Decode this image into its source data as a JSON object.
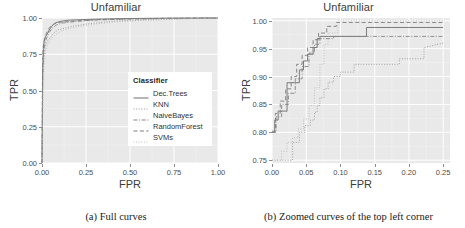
{
  "figure": {
    "panels": [
      {
        "id": "a",
        "title": "Unfamiliar",
        "caption": "(a) Full curves",
        "xlabel": "FPR",
        "ylabel": "TPR",
        "xticks": [
          "0.00",
          "0.25",
          "0.50",
          "0.75",
          "1.00"
        ],
        "yticks": [
          "0.00",
          "0.25",
          "0.50",
          "0.75",
          "1.00"
        ]
      },
      {
        "id": "b",
        "title": "Unfamiliar",
        "caption": "(b) Zoomed curves of the top left corner",
        "xlabel": "FPR",
        "ylabel": "TPR",
        "xticks": [
          "0.00",
          "0.05",
          "0.10",
          "0.15",
          "0.20",
          "0.25"
        ],
        "yticks": [
          "0.75",
          "0.80",
          "0.85",
          "0.90",
          "0.95",
          "1.00"
        ]
      }
    ]
  },
  "legend": {
    "title": "Classifier",
    "items": [
      {
        "label": "Dec.Trees",
        "style": "solid",
        "color": "#6e6e6e"
      },
      {
        "label": "KNN",
        "style": "dotted",
        "color": "#9a9a9a"
      },
      {
        "label": "NaiveBayes",
        "style": "dashdot",
        "color": "#858585"
      },
      {
        "label": "RandomForest",
        "style": "dashed",
        "color": "#7d7d7d"
      },
      {
        "label": "SVMs",
        "style": "finedot",
        "color": "#b0b0b0"
      }
    ]
  },
  "chart_data": [
    {
      "type": "line",
      "panel": "a",
      "title": "Unfamiliar",
      "xlabel": "FPR",
      "ylabel": "TPR",
      "xlim": [
        0.0,
        1.0
      ],
      "ylim": [
        0.0,
        1.0
      ],
      "grid": true,
      "legend_position": "inside-center-right",
      "series": [
        {
          "name": "Dec.Trees",
          "x": [
            0.0,
            0.004,
            0.008,
            0.012,
            0.02,
            0.03,
            0.045,
            0.06,
            0.08,
            0.11,
            0.15,
            0.21,
            0.3,
            0.45,
            0.7,
            1.0
          ],
          "y": [
            0.0,
            0.64,
            0.79,
            0.838,
            0.87,
            0.89,
            0.925,
            0.95,
            0.968,
            0.978,
            0.985,
            0.988,
            0.992,
            0.996,
            0.999,
            1.0
          ]
        },
        {
          "name": "KNN",
          "x": [
            0.0,
            0.005,
            0.01,
            0.018,
            0.03,
            0.048,
            0.07,
            0.095,
            0.13,
            0.185,
            0.26,
            0.38,
            0.56,
            0.8,
            1.0
          ],
          "y": [
            0.0,
            0.56,
            0.72,
            0.8,
            0.84,
            0.866,
            0.9,
            0.92,
            0.93,
            0.946,
            0.96,
            0.976,
            0.988,
            0.996,
            1.0
          ]
        },
        {
          "name": "NaiveBayes",
          "x": [
            0.0,
            0.004,
            0.009,
            0.016,
            0.026,
            0.04,
            0.058,
            0.082,
            0.115,
            0.16,
            0.23,
            0.34,
            0.52,
            0.76,
            1.0
          ],
          "y": [
            0.0,
            0.6,
            0.76,
            0.82,
            0.862,
            0.9,
            0.93,
            0.952,
            0.965,
            0.972,
            0.98,
            0.988,
            0.993,
            0.998,
            1.0
          ]
        },
        {
          "name": "RandomForest",
          "x": [
            0.0,
            0.003,
            0.007,
            0.013,
            0.022,
            0.034,
            0.05,
            0.072,
            0.1,
            0.145,
            0.205,
            0.3,
            0.47,
            0.72,
            1.0
          ],
          "y": [
            0.0,
            0.68,
            0.805,
            0.85,
            0.885,
            0.918,
            0.945,
            0.962,
            0.97,
            0.975,
            0.981,
            0.988,
            0.994,
            0.998,
            1.0
          ]
        },
        {
          "name": "SVMs",
          "x": [
            0.0,
            0.006,
            0.012,
            0.022,
            0.036,
            0.055,
            0.08,
            0.112,
            0.155,
            0.215,
            0.3,
            0.43,
            0.62,
            0.84,
            1.0
          ],
          "y": [
            0.0,
            0.52,
            0.69,
            0.78,
            0.826,
            0.86,
            0.888,
            0.912,
            0.928,
            0.942,
            0.958,
            0.974,
            0.986,
            0.995,
            1.0
          ]
        }
      ]
    },
    {
      "type": "line",
      "panel": "b",
      "title": "Unfamiliar",
      "xlabel": "FPR",
      "ylabel": "TPR",
      "xlim": [
        0.0,
        0.26
      ],
      "ylim": [
        0.745,
        1.005
      ],
      "grid": true,
      "legend_position": "none",
      "series": [
        {
          "name": "Dec.Trees",
          "x": [
            0.0,
            0.004,
            0.004,
            0.009,
            0.009,
            0.016,
            0.016,
            0.022,
            0.022,
            0.031,
            0.031,
            0.04,
            0.04,
            0.046,
            0.046,
            0.052,
            0.052,
            0.06,
            0.06,
            0.066,
            0.066,
            0.07,
            0.07,
            0.138,
            0.138,
            0.222,
            0.222,
            0.25
          ],
          "y": [
            0.8,
            0.8,
            0.822,
            0.822,
            0.838,
            0.838,
            0.838,
            0.838,
            0.889,
            0.889,
            0.889,
            0.889,
            0.912,
            0.912,
            0.928,
            0.928,
            0.94,
            0.94,
            0.952,
            0.952,
            0.968,
            0.968,
            0.972,
            0.972,
            0.988,
            0.988,
            0.988,
            0.988
          ]
        },
        {
          "name": "KNN",
          "x": [
            0.0,
            0.03,
            0.03,
            0.04,
            0.04,
            0.048,
            0.048,
            0.056,
            0.056,
            0.062,
            0.062,
            0.066,
            0.066,
            0.07,
            0.07,
            0.076,
            0.076,
            0.082,
            0.082,
            0.09,
            0.09,
            0.1,
            0.1,
            0.12,
            0.12,
            0.186,
            0.186,
            0.222,
            0.222,
            0.25
          ],
          "y": [
            0.75,
            0.75,
            0.782,
            0.782,
            0.8,
            0.8,
            0.812,
            0.812,
            0.822,
            0.822,
            0.836,
            0.836,
            0.848,
            0.848,
            0.862,
            0.862,
            0.878,
            0.878,
            0.89,
            0.89,
            0.9,
            0.9,
            0.908,
            0.908,
            0.922,
            0.922,
            0.932,
            0.932,
            0.952,
            0.96
          ]
        },
        {
          "name": "NaiveBayes",
          "x": [
            0.0,
            0.006,
            0.006,
            0.014,
            0.014,
            0.024,
            0.024,
            0.034,
            0.034,
            0.044,
            0.044,
            0.054,
            0.054,
            0.062,
            0.062,
            0.07,
            0.07,
            0.09,
            0.09,
            0.14,
            0.14,
            0.25
          ],
          "y": [
            0.8,
            0.8,
            0.828,
            0.828,
            0.85,
            0.85,
            0.87,
            0.87,
            0.896,
            0.896,
            0.918,
            0.918,
            0.942,
            0.942,
            0.958,
            0.958,
            0.968,
            0.968,
            0.972,
            0.972,
            0.972,
            0.972
          ]
        },
        {
          "name": "RandomForest",
          "x": [
            0.0,
            0.005,
            0.005,
            0.012,
            0.012,
            0.02,
            0.02,
            0.028,
            0.028,
            0.036,
            0.036,
            0.044,
            0.044,
            0.052,
            0.052,
            0.06,
            0.06,
            0.068,
            0.068,
            0.08,
            0.08,
            0.094,
            0.094,
            0.25
          ],
          "y": [
            0.802,
            0.802,
            0.834,
            0.834,
            0.856,
            0.856,
            0.878,
            0.878,
            0.9,
            0.9,
            0.922,
            0.922,
            0.938,
            0.938,
            0.952,
            0.952,
            0.966,
            0.966,
            0.978,
            0.978,
            0.99,
            0.99,
            0.997,
            0.997
          ]
        },
        {
          "name": "SVMs",
          "x": [
            0.0,
            0.014,
            0.014,
            0.022,
            0.022,
            0.03,
            0.03,
            0.038,
            0.038,
            0.046,
            0.046,
            0.054,
            0.054,
            0.062,
            0.062,
            0.07,
            0.07,
            0.076,
            0.076,
            0.082,
            0.082,
            0.096,
            0.096,
            0.25
          ],
          "y": [
            0.75,
            0.75,
            0.766,
            0.766,
            0.782,
            0.782,
            0.79,
            0.79,
            0.806,
            0.806,
            0.824,
            0.824,
            0.848,
            0.848,
            0.88,
            0.88,
            0.922,
            0.922,
            0.958,
            0.958,
            0.978,
            0.978,
            1.0,
            1.0
          ]
        }
      ]
    }
  ]
}
